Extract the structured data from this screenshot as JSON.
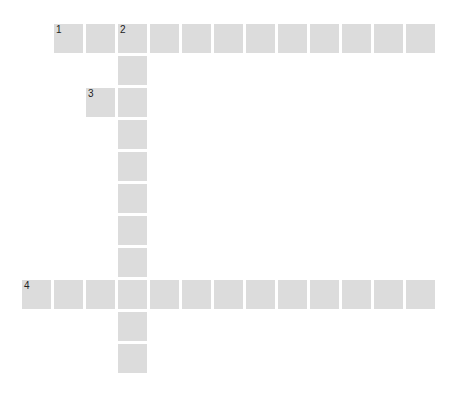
{
  "puzzle": {
    "type": "crossword",
    "cell_color": "#dcdcdc",
    "number_color": "#222222",
    "origin": {
      "x": 22,
      "y": 24
    },
    "pitch": 32,
    "cells": [
      {
        "row": 0,
        "col": 1,
        "number": "1"
      },
      {
        "row": 0,
        "col": 2,
        "number": ""
      },
      {
        "row": 0,
        "col": 3,
        "number": "2"
      },
      {
        "row": 0,
        "col": 4,
        "number": ""
      },
      {
        "row": 0,
        "col": 5,
        "number": ""
      },
      {
        "row": 0,
        "col": 6,
        "number": ""
      },
      {
        "row": 0,
        "col": 7,
        "number": ""
      },
      {
        "row": 0,
        "col": 8,
        "number": ""
      },
      {
        "row": 0,
        "col": 9,
        "number": ""
      },
      {
        "row": 0,
        "col": 10,
        "number": ""
      },
      {
        "row": 0,
        "col": 11,
        "number": ""
      },
      {
        "row": 0,
        "col": 12,
        "number": ""
      },
      {
        "row": 1,
        "col": 3,
        "number": ""
      },
      {
        "row": 2,
        "col": 2,
        "number": "3"
      },
      {
        "row": 2,
        "col": 3,
        "number": ""
      },
      {
        "row": 3,
        "col": 3,
        "number": ""
      },
      {
        "row": 4,
        "col": 3,
        "number": ""
      },
      {
        "row": 5,
        "col": 3,
        "number": ""
      },
      {
        "row": 6,
        "col": 3,
        "number": ""
      },
      {
        "row": 7,
        "col": 3,
        "number": ""
      },
      {
        "row": 8,
        "col": 0,
        "number": "4"
      },
      {
        "row": 8,
        "col": 1,
        "number": ""
      },
      {
        "row": 8,
        "col": 2,
        "number": ""
      },
      {
        "row": 8,
        "col": 3,
        "number": ""
      },
      {
        "row": 8,
        "col": 4,
        "number": ""
      },
      {
        "row": 8,
        "col": 5,
        "number": ""
      },
      {
        "row": 8,
        "col": 6,
        "number": ""
      },
      {
        "row": 8,
        "col": 7,
        "number": ""
      },
      {
        "row": 8,
        "col": 8,
        "number": ""
      },
      {
        "row": 8,
        "col": 9,
        "number": ""
      },
      {
        "row": 8,
        "col": 10,
        "number": ""
      },
      {
        "row": 8,
        "col": 11,
        "number": ""
      },
      {
        "row": 8,
        "col": 12,
        "number": ""
      },
      {
        "row": 9,
        "col": 3,
        "number": ""
      },
      {
        "row": 10,
        "col": 3,
        "number": ""
      }
    ],
    "entries": [
      {
        "number": "1",
        "direction": "across",
        "length": 12
      },
      {
        "number": "2",
        "direction": "down",
        "length": 11
      },
      {
        "number": "3",
        "direction": "across",
        "length": 2
      },
      {
        "number": "4",
        "direction": "across",
        "length": 13
      }
    ]
  }
}
